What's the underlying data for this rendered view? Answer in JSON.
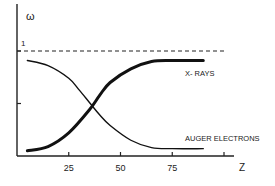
{
  "chart_data": {
    "type": "line",
    "title": "",
    "xlabel": "Z",
    "ylabel": "ω",
    "xlim": [
      0,
      100
    ],
    "ylim": [
      0,
      1
    ],
    "x_ticks": [
      25,
      50,
      75,
      100
    ],
    "x_tick_labels": [
      "25",
      "50",
      "75",
      ""
    ],
    "y_ticks": [
      0.5,
      1
    ],
    "y_tick_labels": [
      "",
      "1"
    ],
    "reference_line": {
      "y": 1,
      "style": "dashed"
    },
    "grid": false,
    "legend": "inline labels at right end of curves",
    "series": [
      {
        "name": "X- RAYS",
        "style": "thick",
        "x": [
          5,
          15,
          25,
          35,
          40,
          45,
          55,
          65,
          75,
          90
        ],
        "y": [
          0.05,
          0.09,
          0.22,
          0.44,
          0.58,
          0.7,
          0.83,
          0.9,
          0.91,
          0.91
        ]
      },
      {
        "name": "AUGER ELECTRONS",
        "style": "thin",
        "x": [
          5,
          15,
          25,
          30,
          35,
          40,
          45,
          55,
          65,
          75,
          90
        ],
        "y": [
          0.91,
          0.86,
          0.74,
          0.63,
          0.51,
          0.39,
          0.29,
          0.15,
          0.08,
          0.07,
          0.07
        ]
      }
    ]
  }
}
